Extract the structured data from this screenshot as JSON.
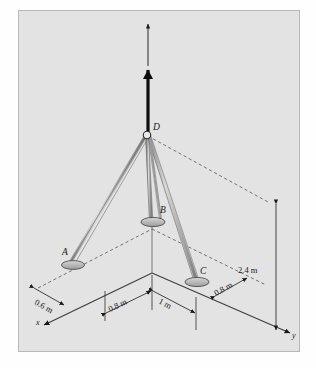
{
  "figure": {
    "background_color": "#e3e3e3",
    "line_color": "#4a4a4a",
    "ink_color": "#1a1a1a"
  },
  "nodes": [
    {
      "id": "A",
      "label": "A"
    },
    {
      "id": "B",
      "label": "B"
    },
    {
      "id": "C",
      "label": "C"
    },
    {
      "id": "D",
      "label": "D"
    }
  ],
  "axes": [
    {
      "id": "x",
      "label": "x"
    },
    {
      "id": "y",
      "label": "y"
    }
  ],
  "dimensions": [
    {
      "id": "dim-0-6",
      "label": "0.6 m",
      "value": 0.6,
      "unit": "m"
    },
    {
      "id": "dim-0-8-left",
      "label": "0.8 m",
      "value": 0.8,
      "unit": "m"
    },
    {
      "id": "dim-1",
      "label": "1 m",
      "value": 1,
      "unit": "m"
    },
    {
      "id": "dim-0-8-right",
      "label": "0.8 m",
      "value": 0.8,
      "unit": "m"
    },
    {
      "id": "dim-2-4",
      "label": "2.4 m",
      "value": 2.4,
      "unit": "m"
    }
  ],
  "caption": ""
}
